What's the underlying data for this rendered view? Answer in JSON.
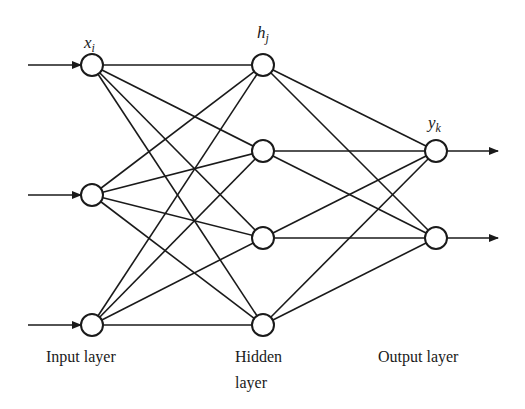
{
  "diagram": {
    "type": "feedforward-neural-network",
    "layers": [
      {
        "name": "input",
        "label": "Input layer",
        "var": "x",
        "sub": "i",
        "nodes": 3
      },
      {
        "name": "hidden",
        "label_line1": "Hidden",
        "label_line2": "layer",
        "var": "h",
        "sub": "j",
        "nodes": 4
      },
      {
        "name": "output",
        "label": "Output layer",
        "var": "y",
        "sub": "k",
        "nodes": 2
      }
    ],
    "stroke_color": "#1a1a1a",
    "node_fill": "#ffffff"
  }
}
